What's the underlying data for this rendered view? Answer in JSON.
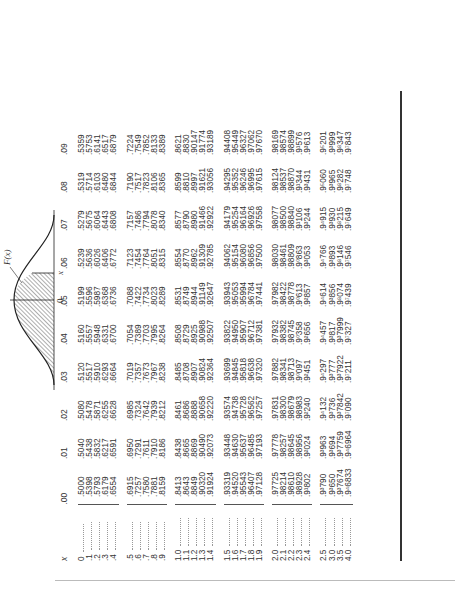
{
  "figure": {
    "curve_label": "F(x)",
    "origin_label": "0",
    "x_label": "x"
  },
  "table": {
    "header_x": "x",
    "columns": [
      ".00",
      ".01",
      ".02",
      ".03",
      ".04",
      ".05",
      ".06",
      ".07",
      ".08",
      ".09"
    ],
    "groups": [
      [
        {
          "x": "0",
          "v": [
            ".5000",
            ".5040",
            ".5080",
            ".5120",
            ".5160",
            ".5199",
            ".5239",
            ".5279",
            ".5319",
            ".5359"
          ]
        },
        {
          "x": ".1",
          "v": [
            ".5398",
            ".5438",
            ".5478",
            ".5517",
            ".5557",
            ".5596",
            ".5636",
            ".5675",
            ".5714",
            ".5753"
          ]
        },
        {
          "x": ".2",
          "v": [
            ".5793",
            ".5832",
            ".5871",
            ".5910",
            ".5948",
            ".5987",
            ".6026",
            ".6064",
            ".6103",
            ".6141"
          ]
        },
        {
          "x": ".3",
          "v": [
            ".6179",
            ".6217",
            ".6255",
            ".6293",
            ".6331",
            ".6368",
            ".6406",
            ".6443",
            ".6480",
            ".6517"
          ]
        },
        {
          "x": ".4",
          "v": [
            ".6554",
            ".6591",
            ".6628",
            ".6664",
            ".6700",
            ".6736",
            ".6772",
            ".6808",
            ".6844",
            ".6879"
          ]
        }
      ],
      [
        {
          "x": ".5",
          "v": [
            ".6915",
            ".6950",
            ".6985",
            ".7019",
            ".7054",
            ".7088",
            ".7123",
            ".7157",
            ".7190",
            ".7224"
          ]
        },
        {
          "x": ".6",
          "v": [
            ".7257",
            ".7291",
            ".7324",
            ".7357",
            ".7389",
            ".7422",
            ".7454",
            ".7486",
            ".7517",
            ".7549"
          ]
        },
        {
          "x": ".7",
          "v": [
            ".7580",
            ".7611",
            ".7642",
            ".7673",
            ".7703",
            ".7734",
            ".7764",
            ".7794",
            ".7823",
            ".7852"
          ]
        },
        {
          "x": ".8",
          "v": [
            ".7881",
            ".7910",
            ".7939",
            ".7967",
            ".7995",
            ".8023",
            ".8051",
            ".8078",
            ".8106",
            ".8133"
          ]
        },
        {
          "x": ".9",
          "v": [
            ".8159",
            ".8186",
            ".8212",
            ".8238",
            ".8264",
            ".8289",
            ".8315",
            ".8340",
            ".8365",
            ".8389"
          ]
        }
      ],
      [
        {
          "x": "1.0",
          "v": [
            ".8413",
            ".8438",
            ".8461",
            ".8485",
            ".8508",
            ".8531",
            ".8554",
            ".8577",
            ".8599",
            ".8621"
          ]
        },
        {
          "x": "1.1",
          "v": [
            ".8643",
            ".8665",
            ".8686",
            ".8708",
            ".8729",
            ".8749",
            ".8770",
            ".8790",
            ".8810",
            ".8830"
          ]
        },
        {
          "x": "1.2",
          "v": [
            ".8849",
            ".8869",
            ".8888",
            ".8907",
            ".8925",
            ".8944",
            ".8962",
            ".8980",
            ".8997",
            ".90147"
          ]
        },
        {
          "x": "1.3",
          "v": [
            ".90320",
            ".90490",
            ".90658",
            ".90824",
            ".90988",
            ".91149",
            ".91309",
            ".91466",
            ".91621",
            ".91774"
          ]
        },
        {
          "x": "1.4",
          "v": [
            ".91924",
            ".92073",
            ".92220",
            ".92364",
            ".92507",
            ".92647",
            ".92785",
            ".92922",
            ".93056",
            ".93189"
          ]
        }
      ],
      [
        {
          "x": "1.5",
          "v": [
            ".93319",
            ".93448",
            ".93574",
            ".93699",
            ".93822",
            ".93943",
            ".94062",
            ".94179",
            ".94295",
            ".94408"
          ]
        },
        {
          "x": "1.6",
          "v": [
            ".94520",
            ".94630",
            ".94738",
            ".94845",
            ".94950",
            ".95053",
            ".95154",
            ".95254",
            ".95352",
            ".95449"
          ]
        },
        {
          "x": "1.7",
          "v": [
            ".95543",
            ".95637",
            ".95728",
            ".95818",
            ".95907",
            ".95994",
            ".96080",
            ".96164",
            ".96246",
            ".96327"
          ]
        },
        {
          "x": "1.8",
          "v": [
            ".96407",
            ".96485",
            ".96562",
            ".96638",
            ".96712",
            ".96784",
            ".96856",
            ".96926",
            ".96995",
            ".97062"
          ]
        },
        {
          "x": "1.9",
          "v": [
            ".97128",
            ".97193",
            ".97257",
            ".97320",
            ".97381",
            ".97441",
            ".97500",
            ".97558",
            ".97615",
            ".97670"
          ]
        }
      ],
      [
        {
          "x": "2.0",
          "v": [
            ".97725",
            ".97778",
            ".97831",
            ".97882",
            ".97932",
            ".97982",
            ".98030",
            ".98077",
            ".98124",
            ".98169"
          ]
        },
        {
          "x": "2.1",
          "v": [
            ".98214",
            ".98257",
            ".98300",
            ".98341",
            ".98382",
            ".98422",
            ".98461",
            ".98500",
            ".98537",
            ".98574"
          ]
        },
        {
          "x": "2.2",
          "v": [
            ".98610",
            ".98645",
            ".98679",
            ".98713",
            ".98745",
            ".98778",
            ".98809",
            ".98840",
            ".98870",
            ".98899"
          ]
        },
        {
          "x": "2.3",
          "v": [
            ".98928",
            ".98956",
            ".98983",
            ".9⁰097",
            ".9⁰358",
            ".9⁰613",
            ".9⁰863",
            ".9¹106",
            ".9¹344",
            ".9¹576"
          ]
        },
        {
          "x": "2.4",
          "v": [
            ".9¹802",
            ".9²024",
            ".9²240",
            ".9²451",
            ".9²656",
            ".9²857",
            ".9³053",
            ".9³244",
            ".9³431",
            ".9³613"
          ]
        }
      ],
      [
        {
          "x": "2.5",
          "v": [
            ".9³790",
            ".9³963",
            ".9⁴132",
            ".9⁴297",
            ".9⁴457",
            ".9⁴614",
            ".9⁴766",
            ".9⁴915",
            ".9⁵060",
            ".9⁵201"
          ]
        },
        {
          "x": "3.0",
          "v": [
            ".9³650",
            ".9³694",
            ".9³736",
            ".9³777",
            ".9³817",
            ".9³856",
            ".9³893",
            ".9³930",
            ".9³965",
            ".9³999"
          ]
        },
        {
          "x": "3.5",
          "v": [
            ".9³7674",
            ".9³7759",
            ".9³7842",
            ".9³7922",
            ".9³7999",
            ".9⁸074",
            ".9⁸146",
            ".9⁸215",
            ".9⁸282",
            ".9⁸347"
          ]
        },
        {
          "x": "4.0",
          "v": [
            ".9⁴6833",
            ".9⁴6964",
            ".9⁷090",
            ".9⁷211",
            ".9⁷327",
            ".9⁷439",
            ".9⁷546",
            ".9⁷649",
            ".9⁷748",
            ".9⁷843"
          ]
        }
      ]
    ]
  }
}
